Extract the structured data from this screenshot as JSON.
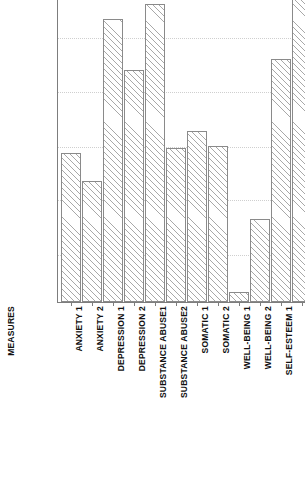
{
  "chart_data": {
    "type": "bar",
    "title": "",
    "xlabel": "MEASURES",
    "ylabel": "",
    "grid": true,
    "legend": "none",
    "orientation": "vertical",
    "note": "Bar for SELF-ESTEEM 2 is clipped by the top edge of the figure.",
    "categories": [
      "ANXIETY 1",
      "ANXIETY 2",
      "DEPRESSION 1",
      "DEPRESSION 2",
      "SUBSTANCE ABUSE1",
      "SUBSTANCE ABUSE2",
      "SOMATIC 1",
      "SOMATIC 2",
      "WELL-BEING 1",
      "WELL-BEING 2",
      "SELF-ESTEEM 1",
      "SELF-ESTEEM 2"
    ],
    "values": [
      149,
      121,
      283,
      232,
      298,
      154,
      171,
      156,
      10,
      83,
      243,
      306
    ],
    "ylim": [
      0,
      302
    ],
    "gridline_values": [
      47,
      102,
      155,
      210,
      264
    ],
    "bar_pixel_tops": [
      153,
      181,
      19,
      70,
      4,
      148,
      131,
      146,
      292,
      219,
      59,
      -4
    ],
    "baseline_pixel": 302,
    "bar_geometry": {
      "plot_left": 57,
      "plot_width": 248,
      "bar_width": 20,
      "bar_pitch": 21,
      "first_bar_left": 4
    },
    "colors": {
      "bar_border": "#8a8a8a",
      "bar_hatch": "#a8a8a8",
      "bar_fill": "#ffffff",
      "gridline": "#cfcfcf",
      "axis": "#7d7d7d",
      "text": "#111111",
      "background": "#ffffff"
    }
  }
}
